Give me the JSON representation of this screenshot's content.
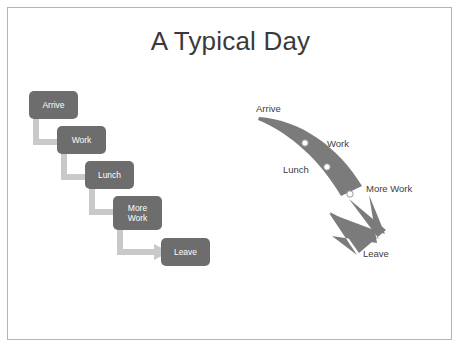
{
  "slide": {
    "title": "A Typical Day",
    "background_color": "#ffffff",
    "frame_border_color": "#b4b4b6"
  },
  "theme": {
    "box_fill": "#6d6d6d",
    "box_text_color": "#ffffff",
    "connector_color": "#c9c9c9",
    "curve_color": "#7b7b7b",
    "marker_fill": "#ffffff",
    "marker_stroke": "#9a9a9a",
    "label_color": "#3d3d3d",
    "title_color": "#3a3a3a"
  },
  "process_diagram": {
    "name": "step-down-process",
    "steps": [
      {
        "label": "Arrive"
      },
      {
        "label": "Work"
      },
      {
        "label": "Lunch"
      },
      {
        "label": "More Work"
      },
      {
        "label": "Leave"
      }
    ]
  },
  "curve_diagram": {
    "name": "descending-curved-arrow",
    "labels": [
      {
        "text": "Arrive"
      },
      {
        "text": "Work"
      },
      {
        "text": "Lunch"
      },
      {
        "text": "More Work"
      },
      {
        "text": "Leave"
      }
    ]
  }
}
